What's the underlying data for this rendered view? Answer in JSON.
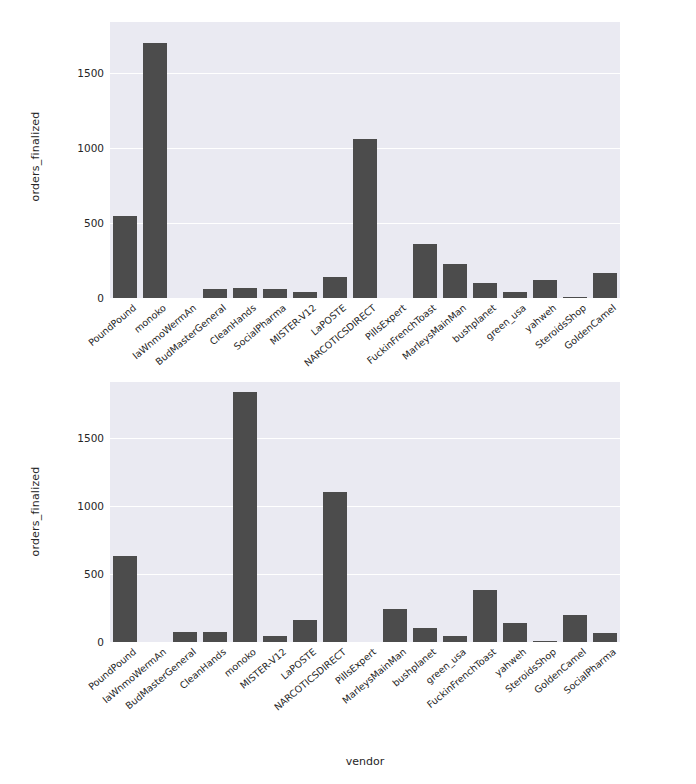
{
  "figure": {
    "width": 696,
    "height": 784,
    "background": "#ffffff",
    "panel_background": "#eaeaf2",
    "bar_color": "#4c4c4c",
    "grid_color": "#ffffff",
    "tick_color": "#262626"
  },
  "chart_data": [
    {
      "type": "bar",
      "title": "",
      "subtitle": "",
      "xlabel": "",
      "ylabel": "orders_finalized",
      "ylim": [
        0,
        1840
      ],
      "yticks": [
        0,
        500,
        1000,
        1500
      ],
      "ytick_labels": [
        "0",
        "500",
        "1000",
        "1500"
      ],
      "grid": true,
      "grid_axis": "y",
      "legend": null,
      "categories": [
        "PoundPound",
        "monoko",
        "laWnmoWermAn",
        "BudMasterGeneral",
        "CleanHands",
        "SocialPharma",
        "MISTER-V12",
        "LaPOSTE",
        "NARCOTICSDIRECT",
        "PillsExpert",
        "FuckinFrenchToast",
        "MarleysMainMan",
        "bushplanet",
        "green_usa",
        "yahweh",
        "SteroidsShop",
        "GoldenCamel"
      ],
      "values": [
        550,
        1700,
        0,
        62,
        65,
        58,
        40,
        140,
        1060,
        0,
        360,
        225,
        100,
        42,
        120,
        8,
        170
      ]
    },
    {
      "type": "bar",
      "title": "",
      "subtitle": "",
      "xlabel": "vendor",
      "ylabel": "orders_finalized",
      "ylim": [
        0,
        1910
      ],
      "yticks": [
        0,
        500,
        1000,
        1500
      ],
      "ytick_labels": [
        "0",
        "500",
        "1000",
        "1500"
      ],
      "grid": true,
      "grid_axis": "y",
      "legend": null,
      "categories": [
        "PoundPound",
        "laWnmoWermAn",
        "BudMasterGeneral",
        "CleanHands",
        "monoko",
        "MISTER-V12",
        "LaPOSTE",
        "NARCOTICSDIRECT",
        "PillsExpert",
        "MarleysMainMan",
        "bushplanet",
        "green_usa",
        "FuckinFrenchToast",
        "yahweh",
        "SteroidsShop",
        "GoldenCamel",
        "SocialPharma"
      ],
      "values": [
        630,
        0,
        70,
        72,
        1840,
        45,
        160,
        1100,
        0,
        245,
        105,
        45,
        385,
        140,
        8,
        195,
        65
      ]
    }
  ]
}
